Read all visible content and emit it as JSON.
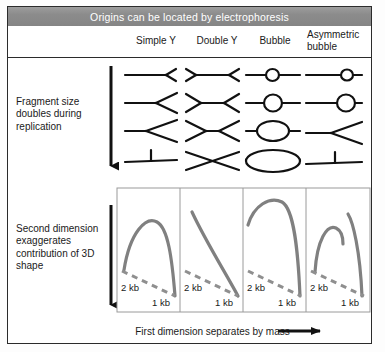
{
  "figure": {
    "title": "Origins can be located by electrophoresis",
    "bottom_caption": "First dimension separates by mass",
    "section_labels": {
      "top": "Fragment size doubles during replication",
      "bottom": "Second dimension exaggerates contribution of 3D shape"
    },
    "columns": [
      {
        "label": "Simple Y",
        "label_lines": [
          "Simple Y"
        ]
      },
      {
        "label": "Double Y",
        "label_lines": [
          "Double Y"
        ]
      },
      {
        "label": "Bubble",
        "label_lines": [
          "Bubble"
        ]
      },
      {
        "label": "Asymmetric bubble",
        "label_lines": [
          "Asymmetric",
          "bubble"
        ]
      }
    ],
    "gel_axis_labels": {
      "left": "2 kb",
      "right": "1 kb"
    },
    "colors": {
      "title_bar": "#8c8c8c",
      "title_text": "#ffffff",
      "frame": "#2b2b2b",
      "molecule_stroke": "#111111",
      "gel_arc": "#808080",
      "gel_dashed": "#8f8f8f",
      "panel_border": "#9a9a9a",
      "background": "#ffffff"
    },
    "molecule_rows": [
      {
        "stage": 1,
        "description": "earliest replication intermediate, smallest branch"
      },
      {
        "stage": 2,
        "description": "branch enlarged"
      },
      {
        "stage": 3,
        "description": "branch near half replicated"
      },
      {
        "stage": 4,
        "description": "nearly fully replicated, branch maximal"
      }
    ],
    "gel_panels": [
      {
        "column": "Simple Y",
        "arc": "symmetric arc peaking near centre, returns to 1 kb"
      },
      {
        "column": "Double Y",
        "arc": "steep straight descending line from upper left to 1 kb"
      },
      {
        "column": "Bubble",
        "arc": "tall arc rising steeply, plateau, then near-vertical drop to 1 kb"
      },
      {
        "column": "Asymmetric bubble",
        "arc": "two separate curves: short left arc and tall right arc"
      }
    ]
  }
}
